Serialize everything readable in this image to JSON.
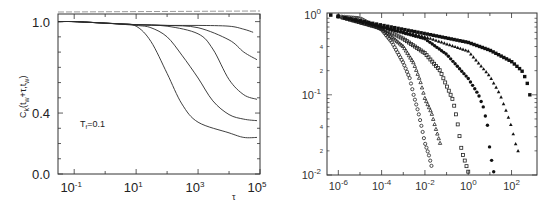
{
  "chart_data": [
    {
      "type": "line",
      "panel": "left",
      "title": "",
      "xlabel": "τ",
      "ylabel": "C_k(t_w+τ,t_w)",
      "xscale": "log",
      "xlim": [
        0.03,
        100000
      ],
      "ylim": [
        0.0,
        1.05
      ],
      "x_ticks": [
        "10^-1",
        "10^1",
        "10^3",
        "10^5"
      ],
      "y_ticks": [
        "0.0",
        "0.4",
        "1.0"
      ],
      "annotation": "T_f=0.1",
      "grid": false,
      "series": [
        {
          "name": "curve-1",
          "x": [
            0.03,
            0.1,
            1,
            3,
            10,
            30,
            100,
            300,
            1000,
            10000,
            30000,
            80000
          ],
          "values": [
            1.0,
            1.0,
            0.99,
            0.985,
            0.97,
            0.87,
            0.66,
            0.46,
            0.34,
            0.27,
            0.24,
            0.24
          ]
        },
        {
          "name": "curve-2",
          "x": [
            0.03,
            0.1,
            1,
            10,
            30,
            100,
            300,
            1000,
            3000,
            10000,
            30000,
            80000
          ],
          "values": [
            1.0,
            1.0,
            0.99,
            0.975,
            0.96,
            0.9,
            0.78,
            0.63,
            0.48,
            0.39,
            0.36,
            0.35
          ]
        },
        {
          "name": "curve-3",
          "x": [
            0.03,
            0.1,
            1,
            10,
            100,
            1000,
            3000,
            10000,
            30000,
            80000
          ],
          "values": [
            1.0,
            1.0,
            0.99,
            0.98,
            0.97,
            0.92,
            0.82,
            0.62,
            0.52,
            0.49
          ]
        },
        {
          "name": "curve-4",
          "x": [
            0.03,
            0.1,
            1,
            10,
            100,
            1000,
            10000,
            30000,
            80000
          ],
          "values": [
            1.0,
            1.0,
            0.99,
            0.98,
            0.975,
            0.96,
            0.88,
            0.8,
            0.75
          ]
        },
        {
          "name": "curve-5",
          "x": [
            0.03,
            0.1,
            1,
            10,
            100,
            1000,
            10000,
            30000,
            60000
          ],
          "values": [
            1.0,
            1.0,
            0.99,
            0.98,
            0.975,
            0.975,
            0.97,
            0.95,
            0.93
          ]
        }
      ]
    },
    {
      "type": "scatter",
      "panel": "right",
      "title": "",
      "xlabel": "",
      "ylabel": "",
      "xscale": "log",
      "yscale": "log",
      "xlim": [
        1e-06,
        1000
      ],
      "ylim": [
        0.01,
        1.0
      ],
      "x_ticks": [
        "10^-6",
        "10^-4",
        "10^-2",
        "10^0",
        "10^2"
      ],
      "y_ticks": [
        "10^0",
        "10^-1",
        "10^-2"
      ],
      "y_minor_labels": [
        "4",
        "2",
        "4",
        "2"
      ],
      "grid": false,
      "series": [
        {
          "name": "open-circles",
          "marker": "o",
          "x": [
            1e-06,
            1e-05,
            0.0001,
            0.0003,
            0.001,
            0.002,
            0.003,
            0.005,
            0.007,
            0.01,
            0.015,
            0.02
          ],
          "values": [
            0.95,
            0.9,
            0.65,
            0.45,
            0.25,
            0.16,
            0.1,
            0.06,
            0.04,
            0.025,
            0.018,
            0.013
          ]
        },
        {
          "name": "triangles",
          "marker": "^",
          "x": [
            1e-06,
            0.0001,
            0.001,
            0.003,
            0.006,
            0.01,
            0.02,
            0.03,
            0.05
          ],
          "values": [
            0.95,
            0.67,
            0.4,
            0.25,
            0.15,
            0.09,
            0.06,
            0.04,
            0.025
          ]
        },
        {
          "name": "open-squares",
          "marker": "s",
          "x": [
            1e-06,
            0.0001,
            0.001,
            0.01,
            0.05,
            0.1,
            0.2,
            0.3,
            0.5,
            1.0
          ],
          "values": [
            0.95,
            0.68,
            0.5,
            0.33,
            0.2,
            0.13,
            0.085,
            0.05,
            0.02,
            0.011
          ]
        },
        {
          "name": "filled-circles",
          "marker": "●",
          "x": [
            1e-06,
            0.0001,
            0.01,
            0.1,
            1,
            3,
            5,
            8,
            10,
            15
          ],
          "values": [
            0.95,
            0.7,
            0.5,
            0.32,
            0.16,
            0.1,
            0.07,
            0.04,
            0.02,
            0.011
          ]
        },
        {
          "name": "filled-triangles",
          "marker": "▲",
          "x": [
            1e-06,
            0.0001,
            0.01,
            1,
            10,
            30,
            60,
            100,
            150,
            200
          ],
          "values": [
            0.95,
            0.72,
            0.53,
            0.35,
            0.17,
            0.1,
            0.06,
            0.04,
            0.025,
            0.02
          ]
        },
        {
          "name": "filled-squares",
          "marker": "■",
          "x": [
            1e-06,
            0.0001,
            0.01,
            1,
            10,
            100,
            300,
            500,
            700
          ],
          "values": [
            0.95,
            0.74,
            0.58,
            0.45,
            0.36,
            0.26,
            0.2,
            0.15,
            0.1
          ]
        }
      ]
    }
  ],
  "left": {
    "ylabel": "C",
    "ylabel_sub": "k",
    "ylabel_rest": "(t",
    "ylabel_sub2": "w",
    "ylabel_rest2": "+τ,t",
    "ylabel_sub3": "w",
    "ylabel_end": ")",
    "xlabel": "τ",
    "annotation_main": "T",
    "annotation_sub": "f",
    "annotation_rest": "=0.1",
    "yticks": [
      {
        "label": "1.0",
        "v": 1.0
      },
      {
        "label": "0.4",
        "v": 0.4
      },
      {
        "label": "0.0",
        "v": 0.0
      }
    ],
    "xticks": [
      {
        "base": "10",
        "exp": "-1",
        "d": -1
      },
      {
        "base": "10",
        "exp": "1",
        "d": 1
      },
      {
        "base": "10",
        "exp": "3",
        "d": 3
      },
      {
        "base": "10",
        "exp": "5",
        "d": 5
      }
    ]
  },
  "right": {
    "yticks": [
      {
        "base": "10",
        "exp": "0",
        "d": 0
      },
      {
        "base": "10",
        "exp": "-1",
        "d": -1
      },
      {
        "base": "10",
        "exp": "-2",
        "d": -2
      }
    ],
    "yminor": [
      {
        "label": "4",
        "v": 0.4
      },
      {
        "label": "2",
        "v": 0.2
      },
      {
        "label": "4",
        "v": 0.04
      },
      {
        "label": "2",
        "v": 0.02
      }
    ],
    "xticks": [
      {
        "base": "10",
        "exp": "-6",
        "d": -6
      },
      {
        "base": "10",
        "exp": "-4",
        "d": -4
      },
      {
        "base": "10",
        "exp": "-2",
        "d": -2
      },
      {
        "base": "10",
        "exp": "0",
        "d": 0
      },
      {
        "base": "10",
        "exp": "2",
        "d": 2
      }
    ]
  }
}
